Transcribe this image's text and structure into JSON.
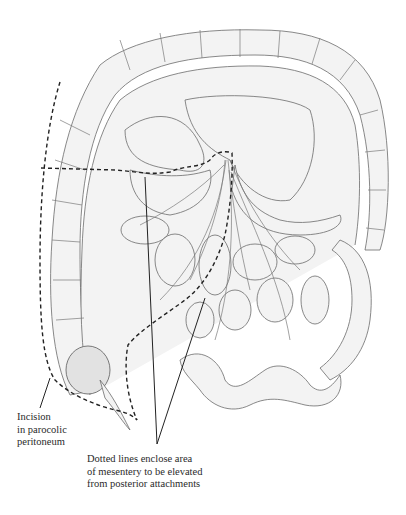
{
  "figure": {
    "labels": {
      "incision": "Incision\nin parocolic\nperitoneum",
      "dotted_lines": "Dotted lines enclose area\nof mesentery to be elevated\nfrom posterior attachments"
    },
    "colors": {
      "line": "#222222",
      "organ_fill": "#f3f3f3",
      "organ_stroke": "#6b6b6b"
    }
  }
}
